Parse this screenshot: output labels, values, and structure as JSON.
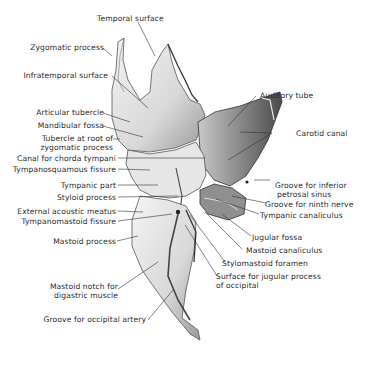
{
  "figure": {
    "labels_left": [
      {
        "id": "temporal-surface",
        "text": "Temporal surface"
      },
      {
        "id": "zygomatic-process",
        "text": "Zygomatic process"
      },
      {
        "id": "infratemporal-surface",
        "text": "Infratemporal surface"
      },
      {
        "id": "articular-tubercle",
        "text": "Articular tubercle"
      },
      {
        "id": "mandibular-fossa",
        "text": "Mandibular fossa"
      },
      {
        "id": "tubercle-root-zygomatic",
        "text": "Tubercle at root of",
        "text2": "zygomatic process"
      },
      {
        "id": "canal-chorda-tympani",
        "text": "Canal for chorda tympani"
      },
      {
        "id": "tympanosquamous-fissure",
        "text": "Tympanosquamous fissure"
      },
      {
        "id": "tympanic-part",
        "text": "Tympanic part"
      },
      {
        "id": "styloid-process",
        "text": "Styloid process"
      },
      {
        "id": "external-acoustic-meatus",
        "text": "External acoustic meatus"
      },
      {
        "id": "tympanomastoid-fissure",
        "text": "Tympanomastoid fissure"
      },
      {
        "id": "mastoid-process",
        "text": "Mastoid process"
      },
      {
        "id": "mastoid-notch",
        "text": "Mastoid notch for",
        "text2": "digastric muscle"
      },
      {
        "id": "groove-occipital-artery",
        "text": "Groove for occipital artery"
      }
    ],
    "labels_right": [
      {
        "id": "auditory-tube",
        "text": "Auditory tube"
      },
      {
        "id": "carotid-canal",
        "text": "Carotid canal"
      },
      {
        "id": "groove-inferior-petrosal",
        "text": "Groove for inferior",
        "text2": "petrosal sinus"
      },
      {
        "id": "groove-ninth-nerve",
        "text": "Groove for ninth nerve"
      },
      {
        "id": "tympanic-canaliculus",
        "text": "Tympanic canaliculus"
      },
      {
        "id": "jugular-fossa",
        "text": "Jugular fossa"
      },
      {
        "id": "mastoid-canaliculus",
        "text": "Mastoid canaliculus"
      },
      {
        "id": "stylomastoid-foramen",
        "text": "Stylomastoid foramen"
      },
      {
        "id": "surface-jugular-process",
        "text": "Surface for jugular process",
        "text2": "of occipital"
      }
    ]
  }
}
